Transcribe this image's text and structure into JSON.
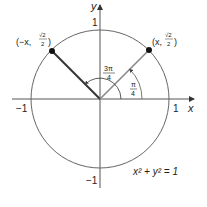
{
  "diagram": {
    "equation": "x² + y² = 1",
    "axes": {
      "x_label": "x",
      "y_label": "y",
      "x_ticks": [
        "−1",
        "1"
      ],
      "y_ticks": [
        "1",
        "−1"
      ]
    },
    "points": [
      {
        "name": "Q",
        "label_prefix": "(−x, ",
        "num": "√2",
        "den": "2",
        "label_suffix": ")",
        "angle": "3π/4"
      },
      {
        "name": "P",
        "label_prefix": "(x, ",
        "num": "√2",
        "den": "2",
        "label_suffix": ")",
        "angle": "π/4"
      }
    ],
    "angles": [
      {
        "num": "3π",
        "den": "4"
      },
      {
        "num": "π",
        "den": "4"
      }
    ]
  }
}
